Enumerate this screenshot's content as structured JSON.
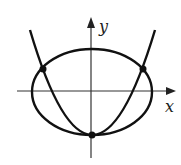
{
  "diagram": {
    "axes": {
      "x_label": "x",
      "y_label": "y"
    },
    "curves": [
      {
        "name": "ellipse",
        "shape": "ellipse",
        "center": [
          0,
          0
        ]
      },
      {
        "name": "parabola",
        "shape": "parabola",
        "opens": "up"
      }
    ],
    "intersection_points": 3,
    "colors": {
      "stroke": "#111111",
      "background": "#ffffff"
    }
  }
}
